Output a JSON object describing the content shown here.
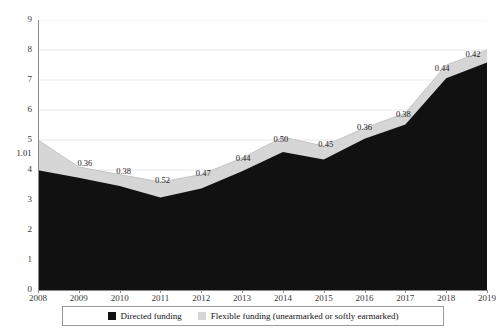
{
  "chart_data": {
    "type": "area",
    "title": "",
    "subtitle": "",
    "xlabel": "",
    "ylabel": "",
    "stacked": true,
    "grid": true,
    "grid_axis": "y",
    "ylim": [
      0,
      9
    ],
    "ytick_step": 1,
    "yticks": [
      "0",
      "1",
      "2",
      "3",
      "4",
      "5",
      "6",
      "7",
      "8",
      "9"
    ],
    "categories": [
      "2008",
      "2009",
      "2010",
      "2011",
      "2012",
      "2013",
      "2014",
      "2015",
      "2016",
      "2017",
      "2018",
      "2019"
    ],
    "legend_position": "bottom",
    "series": [
      {
        "name": "Directed funding",
        "color": "#111111",
        "values": [
          3.99,
          3.74,
          3.47,
          3.08,
          3.38,
          3.96,
          4.6,
          4.35,
          5.04,
          5.52,
          7.06,
          7.58
        ]
      },
      {
        "name": "Flexible funding (unearmarked or softly earmarked)",
        "color": "#d6d6d6",
        "values": [
          1.01,
          0.36,
          0.38,
          0.52,
          0.47,
          0.44,
          0.5,
          0.45,
          0.36,
          0.38,
          0.44,
          0.42
        ]
      }
    ],
    "data_labels": [
      "1.01",
      "0.36",
      "0.38",
      "0.52",
      "0.47",
      "0.44",
      "0.50",
      "0.45",
      "0.36",
      "0.38",
      "0.44",
      "0.42"
    ],
    "totals": [
      5.0,
      4.1,
      3.85,
      3.6,
      3.85,
      4.4,
      5.1,
      4.8,
      5.4,
      5.9,
      7.5,
      8.0
    ]
  },
  "legend": {
    "items": [
      {
        "label": "Directed funding",
        "color": "#111111"
      },
      {
        "label": "Flexible funding (unearmarked or softly earmarked)",
        "color": "#d6d6d6"
      }
    ]
  },
  "colors": {
    "directed": "#111111",
    "flexible": "#d6d6d6",
    "grid": "#e8e8e8",
    "axis": "#8a8a8a",
    "text": "#3a3a3a"
  }
}
